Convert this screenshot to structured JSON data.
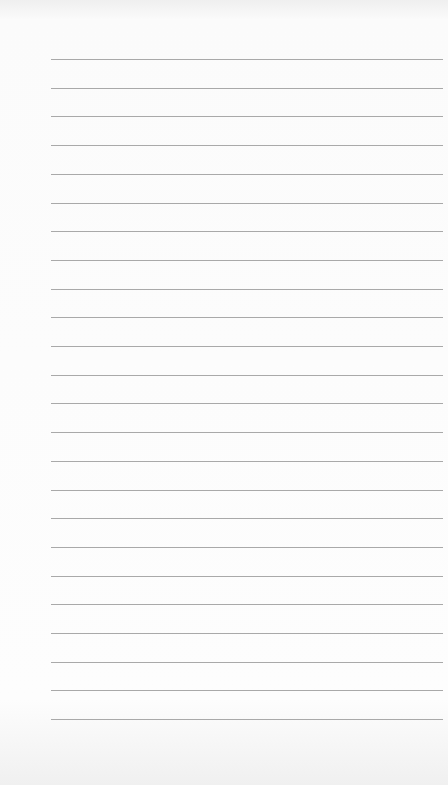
{
  "page": {
    "type": "lined-paper",
    "line_count": 24,
    "first_line_y": 59,
    "line_spacing": 28.7,
    "line_left": 51,
    "line_width": 392,
    "line_color": "#a9a9a9",
    "background_color": "#fcfcfc"
  }
}
